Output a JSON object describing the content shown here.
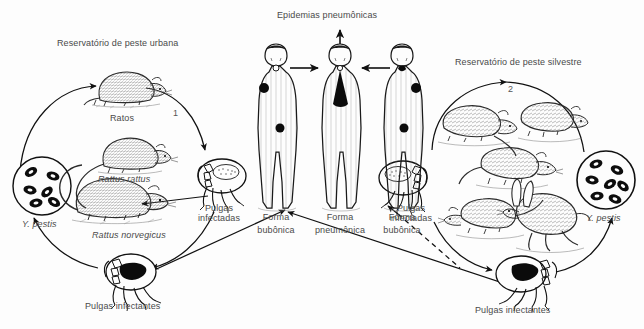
{
  "diagram": {
    "title_top": "Epidemias pneumônicas",
    "reservoir_urban": "Reservatório de peste urbana",
    "reservoir_sylvatic": "Reservatório de peste silvestre",
    "cycle_number_urban": "1",
    "cycle_number_sylvatic": "2",
    "background_color": "#fdfdfd",
    "ink_color": "#1a1a1a",
    "text_color": "#4a4a4a"
  },
  "labels": {
    "rats_common": "Ratos",
    "rattus_rattus": "Rattus rattus",
    "rattus_norvegicus": "Rattus norvegicus",
    "y_pestis_left": "Y. pestis",
    "y_pestis_right": "Y. pestis",
    "infected_fleas_left_line1": "Pulgas",
    "infected_fleas_left_line2": "infectadas",
    "infected_fleas_right_line1": "Pulgas",
    "infected_fleas_right_line2": "infectadas",
    "infecting_fleas_left": "Pulgas infectantes",
    "infecting_fleas_right": "Pulgas infectantes"
  },
  "humans": [
    {
      "id": "human-left",
      "form_line1": "Forma",
      "form_line2": "bubônica"
    },
    {
      "id": "human-center",
      "form_line1": "Forma",
      "form_line2": "pneumônica"
    },
    {
      "id": "human-right",
      "form_line1": "Forma",
      "form_line2": "bubônica"
    }
  ],
  "bacteria": {
    "count_left": 6,
    "count_right": 7,
    "shape": "oval-bacillus"
  },
  "icons": {
    "flea": "flea-icon",
    "rat": "rat-icon",
    "rodent": "wild-rodent-icon",
    "rabbit": "rabbit-icon",
    "human": "human-figure-icon",
    "bacteria_circle": "bacteria-circle-icon",
    "arrow": "arrow-icon",
    "dashed_arrow": "dashed-arrow-icon"
  }
}
